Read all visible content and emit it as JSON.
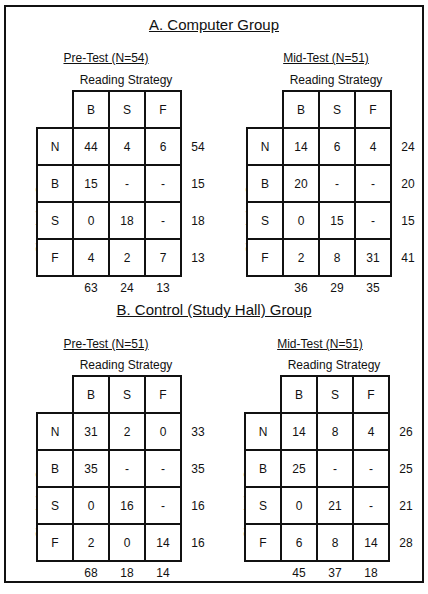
{
  "sections": [
    {
      "title": "A.  Computer Group",
      "tables": [
        {
          "title": "Pre-Test  (N=54)",
          "col_axis_label": "Reading Strategy",
          "row_axis_label": "Simulating Strategy",
          "col_headers": [
            "B",
            "S",
            "F"
          ],
          "row_headers": [
            "N",
            "B",
            "S",
            "F"
          ],
          "cells": [
            [
              "44",
              "4",
              "6"
            ],
            [
              "15",
              "-",
              "-"
            ],
            [
              "0",
              "18",
              "-"
            ],
            [
              "4",
              "2",
              "7"
            ]
          ],
          "row_totals": [
            "54",
            "15",
            "18",
            "13"
          ],
          "col_totals": [
            "63",
            "24",
            "13"
          ]
        },
        {
          "title": "Mid-Test  (N=51)",
          "col_axis_label": "Reading Strategy",
          "row_axis_label": "Simulating Strategy",
          "col_headers": [
            "B",
            "S",
            "F"
          ],
          "row_headers": [
            "N",
            "B",
            "S",
            "F"
          ],
          "cells": [
            [
              "14",
              "6",
              "4"
            ],
            [
              "20",
              "-",
              "-"
            ],
            [
              "0",
              "15",
              "-"
            ],
            [
              "2",
              "8",
              "31"
            ]
          ],
          "row_totals": [
            "24",
            "20",
            "15",
            "41"
          ],
          "col_totals": [
            "36",
            "29",
            "35"
          ]
        }
      ]
    },
    {
      "title": "B.  Control (Study Hall) Group",
      "tables": [
        {
          "title": "Pre-Test  (N=51)",
          "col_axis_label": "Reading Strategy",
          "row_axis_label": "Simulating Strategy",
          "col_headers": [
            "B",
            "S",
            "F"
          ],
          "row_headers": [
            "N",
            "B",
            "S",
            "F"
          ],
          "cells": [
            [
              "31",
              "2",
              "0"
            ],
            [
              "35",
              "-",
              "-"
            ],
            [
              "0",
              "16",
              "-"
            ],
            [
              "2",
              "0",
              "14"
            ]
          ],
          "row_totals": [
            "33",
            "35",
            "16",
            "16"
          ],
          "col_totals": [
            "68",
            "18",
            "14"
          ]
        },
        {
          "title": "Mid-Test  (N=51)",
          "col_axis_label": "Reading Strategy",
          "row_axis_label": "Simulating Strategy",
          "col_headers": [
            "B",
            "S",
            "F"
          ],
          "row_headers": [
            "N",
            "B",
            "S",
            "F"
          ],
          "cells": [
            [
              "14",
              "8",
              "4"
            ],
            [
              "25",
              "-",
              "-"
            ],
            [
              "0",
              "21",
              "-"
            ],
            [
              "6",
              "8",
              "14"
            ]
          ],
          "row_totals": [
            "26",
            "25",
            "21",
            "28"
          ],
          "col_totals": [
            "45",
            "37",
            "18"
          ]
        }
      ]
    }
  ]
}
